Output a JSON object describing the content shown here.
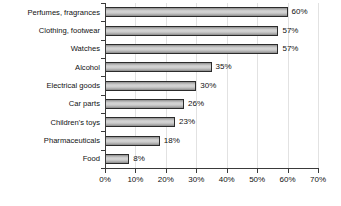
{
  "chart_data": {
    "type": "bar",
    "orientation": "horizontal",
    "title": "",
    "subtitle": "",
    "xlabel": "",
    "ylabel": "",
    "xlim": [
      0,
      70
    ],
    "ylim": null,
    "grid": "vertical",
    "legend": "none",
    "value_suffix": "%",
    "categories": [
      "Perfumes, fragrances",
      "Clothing, footwear",
      "Watches",
      "Alcohol",
      "Electrical goods",
      "Car parts",
      "Children's toys",
      "Pharmaceuticals",
      "Food"
    ],
    "values": [
      60,
      57,
      57,
      35,
      30,
      26,
      23,
      18,
      8
    ],
    "data_labels": [
      "60%",
      "57%",
      "57%",
      "35%",
      "30%",
      "26%",
      "23%",
      "18%",
      "8%"
    ],
    "xticks": [
      0,
      10,
      20,
      30,
      40,
      50,
      60,
      70
    ],
    "xtick_labels": [
      "0%",
      "10%",
      "20%",
      "30%",
      "40%",
      "50%",
      "60%",
      "70%"
    ],
    "colors": {
      "bar_fill_light": "#d6d6d6",
      "bar_fill_dark": "#8e8e8e",
      "bar_border": "#2b2b2b",
      "axis": "#3a3a3a",
      "gridline": "#e2e2e2",
      "text": "#111111",
      "background": "#ffffff"
    }
  }
}
